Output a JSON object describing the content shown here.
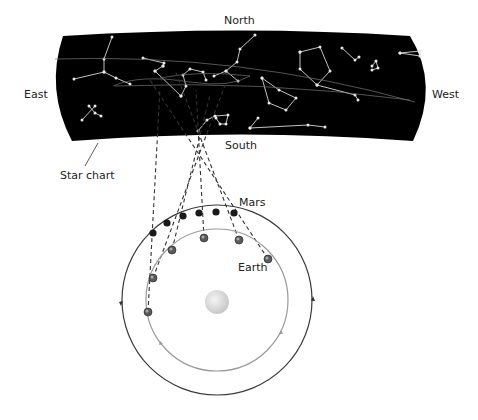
{
  "labels": {
    "north": "North",
    "south": "South",
    "east": "East",
    "west": "West",
    "star_chart": "Star chart",
    "mars": "Mars",
    "earth": "Earth"
  },
  "colors": {
    "sky": "#000000",
    "star": "#d8d8d8",
    "mars_orbit": "#3a3a3a",
    "earth_orbit": "#9a9a9a",
    "sun": "#d9d9d9",
    "mars_dot": "#1a1a1a",
    "earth_dot": "#5a5a5a",
    "sight_line": "#333333"
  },
  "star_chart": {
    "constellations": [
      [
        [
          112,
          37
        ],
        [
          104,
          59
        ],
        [
          104,
          72
        ],
        [
          74,
          79
        ]
      ],
      [
        [
          104,
          72
        ],
        [
          116,
          78
        ],
        [
          130,
          84
        ]
      ],
      [
        [
          89,
          106
        ],
        [
          95,
          113
        ],
        [
          101,
          116
        ]
      ],
      [
        [
          82,
          120
        ],
        [
          95,
          106
        ]
      ],
      [
        [
          143,
          58
        ],
        [
          164,
          63
        ],
        [
          163,
          66
        ]
      ],
      [
        [
          155,
          71
        ],
        [
          181,
          96
        ]
      ],
      [
        [
          155,
          71
        ],
        [
          163,
          66
        ]
      ],
      [
        [
          181,
          96
        ],
        [
          186,
          86
        ],
        [
          183,
          75
        ],
        [
          190,
          69
        ],
        [
          203,
          72
        ],
        [
          206,
          80
        ]
      ],
      [
        [
          255,
          35
        ],
        [
          240,
          49
        ],
        [
          237,
          62
        ],
        [
          226,
          71
        ],
        [
          214,
          76
        ]
      ],
      [
        [
          226,
          71
        ],
        [
          238,
          81
        ]
      ],
      [
        [
          198,
          131
        ],
        [
          207,
          120
        ],
        [
          215,
          116
        ],
        [
          228,
          115
        ],
        [
          226,
          124
        ],
        [
          220,
          124
        ],
        [
          216,
          118
        ]
      ],
      [
        [
          300,
          52
        ],
        [
          320,
          47
        ],
        [
          330,
          71
        ],
        [
          317,
          85
        ],
        [
          300,
          69
        ],
        [
          300,
          52
        ]
      ],
      [
        [
          317,
          85
        ],
        [
          355,
          95
        ],
        [
          358,
          100
        ]
      ],
      [
        [
          262,
          78
        ],
        [
          279,
          90
        ],
        [
          296,
          98
        ],
        [
          286,
          110
        ],
        [
          269,
          103
        ],
        [
          262,
          78
        ]
      ],
      [
        [
          250,
          128
        ],
        [
          258,
          118
        ]
      ],
      [
        [
          250,
          128
        ],
        [
          308,
          125
        ],
        [
          325,
          127
        ]
      ],
      [
        [
          342,
          48
        ],
        [
          355,
          60
        ],
        [
          359,
          57
        ]
      ],
      [
        [
          372,
          66
        ],
        [
          376,
          61
        ],
        [
          378,
          68
        ],
        [
          372,
          70
        ]
      ],
      [
        [
          400,
          53
        ],
        [
          420,
          51
        ],
        [
          420,
          56
        ],
        [
          400,
          53
        ]
      ]
    ],
    "ecliptic_path": "M60,60 Q250,50 415,100",
    "retro_loop": "M113,86 Q170,75 250,90 Q300,98 415,100"
  },
  "orbits": {
    "sun": {
      "cx": 217,
      "cy": 302,
      "r": 12
    },
    "mars": {
      "cx": 217,
      "cy": 300,
      "r": 95
    },
    "earth": {
      "cx": 217,
      "cy": 300,
      "r": 71
    }
  },
  "mars_positions": [
    [
      153,
      233
    ],
    [
      167,
      223
    ],
    [
      183,
      216
    ],
    [
      199,
      213
    ],
    [
      216,
      212
    ],
    [
      234,
      213
    ]
  ],
  "earth_positions": [
    [
      148,
      312
    ],
    [
      153,
      278
    ],
    [
      172,
      250
    ],
    [
      204,
      238
    ],
    [
      239,
      240
    ],
    [
      268,
      259
    ]
  ],
  "sight_lines": [
    {
      "from": [
        268,
        259
      ],
      "to": [
        150,
        80
      ]
    },
    {
      "from": [
        239,
        240
      ],
      "to": [
        175,
        70
      ]
    },
    {
      "from": [
        204,
        238
      ],
      "to": [
        196,
        90
      ]
    },
    {
      "from": [
        172,
        250
      ],
      "to": [
        210,
        95
      ]
    },
    {
      "from": [
        153,
        278
      ],
      "to": [
        225,
        85
      ]
    },
    {
      "from": [
        148,
        312
      ],
      "to": [
        160,
        88
      ]
    }
  ]
}
